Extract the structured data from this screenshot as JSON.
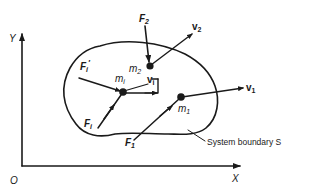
{
  "diagram": {
    "type": "free-body system of particles",
    "axes": {
      "origin_label": "O",
      "x_label": "X",
      "y_label": "Y"
    },
    "boundary": {
      "label": "System boundary S"
    },
    "particles": [
      {
        "id": "m2",
        "mass_label": "m",
        "mass_sub": "2",
        "force_label": "F",
        "force_sub": "2",
        "velocity_label": "v",
        "velocity_sub": "2"
      },
      {
        "id": "mi",
        "mass_label": "m",
        "mass_sub": "i",
        "force_label": "F",
        "force_sub": "i",
        "internal_force_label": "F",
        "internal_force_sub": "i",
        "internal_force_prime": "′",
        "velocity_label": "v",
        "velocity_sub": "i"
      },
      {
        "id": "m1",
        "mass_label": "m",
        "mass_sub": "1",
        "force_label": "F",
        "force_sub": "1",
        "velocity_label": "v",
        "velocity_sub": "1"
      }
    ],
    "colors": {
      "ink": "#1a1a1a",
      "background": "#ffffff"
    }
  }
}
